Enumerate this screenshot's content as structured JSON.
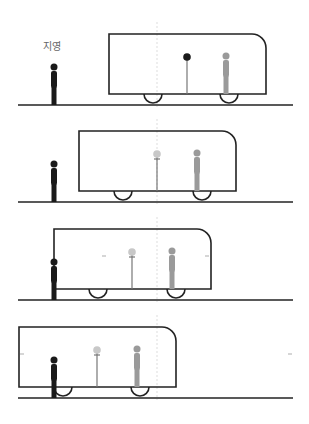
{
  "observer_label": "지영",
  "colors": {
    "outline": "#222222",
    "observer": "#1a1a1a",
    "passenger": "#9a9a9a",
    "pendulum_string": "#777777",
    "pendulum_ball_panel1": "#1a1a1a",
    "pendulum_ball_faded": "#c8c8c8",
    "center_line": "#dddddd",
    "motion_marker": "#bbbbbb"
  },
  "panels": [
    {
      "id": 1,
      "ground_y": 105,
      "car_left": 109,
      "car_right": 266,
      "car_top": 34,
      "car_bottom": 94,
      "observer_x": 54,
      "pendulum_x": 187,
      "passenger_x": 226,
      "wheels_x": [
        153,
        229
      ],
      "ball_dark": true,
      "markers": []
    },
    {
      "id": 2,
      "ground_y": 202,
      "car_left": 79,
      "car_right": 236,
      "car_top": 131,
      "car_bottom": 191,
      "observer_x": 54,
      "pendulum_x": 157,
      "passenger_x": 197,
      "wheels_x": [
        123,
        202
      ],
      "ball_dark": false,
      "markers": []
    },
    {
      "id": 3,
      "ground_y": 300,
      "car_left": 54,
      "car_right": 211,
      "car_top": 229,
      "car_bottom": 289,
      "observer_x": 54,
      "pendulum_x": 132,
      "passenger_x": 172,
      "wheels_x": [
        98,
        176
      ],
      "ball_dark": false,
      "markers": [
        104,
        207
      ]
    },
    {
      "id": 4,
      "ground_y": 398,
      "car_left": 19,
      "car_right": 176,
      "car_top": 327,
      "car_bottom": 387,
      "observer_x": 54,
      "pendulum_x": 97,
      "passenger_x": 137,
      "wheels_x": [
        63,
        140
      ],
      "ball_dark": false,
      "markers": [
        22,
        290
      ]
    }
  ],
  "center_line_x": 157
}
